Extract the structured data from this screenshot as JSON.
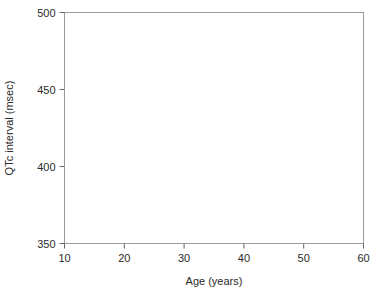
{
  "chart_data": {
    "type": "scatter",
    "title": "",
    "subtitle": "",
    "xlabel": "Age (years)",
    "ylabel": "QTc interval (msec)",
    "xlim": [
      10,
      60
    ],
    "ylim": [
      350,
      500
    ],
    "xticks": [
      10,
      20,
      30,
      40,
      50,
      60
    ],
    "yticks": [
      350,
      400,
      450,
      500
    ],
    "xtick_labels": [
      "10",
      "20",
      "30",
      "40",
      "50",
      "60"
    ],
    "ytick_labels": [
      "350",
      "400",
      "450",
      "500"
    ],
    "grid": false,
    "legend": "none",
    "frame": true,
    "point_color": "#555555",
    "line_color": "#111111",
    "series": [
      {
        "name": "upper-percentile-line",
        "style": "dashed",
        "type": "line",
        "x": [
          10,
          20,
          60
        ],
        "y": [
          441,
          436,
          479
        ]
      },
      {
        "name": "median-regression-line",
        "style": "solid",
        "type": "line",
        "x": [
          10,
          20,
          60
        ],
        "y": [
          415,
          410,
          450
        ]
      },
      {
        "name": "qtc-observations",
        "style": "points",
        "type": "scatter",
        "n_points": 760,
        "x": [
          10.2,
          10.4,
          10.5,
          10.6,
          10.7,
          10.8,
          10.9,
          11.0,
          11.1,
          11.2,
          11.3,
          11.4,
          11.5,
          11.6,
          11.7,
          11.8,
          11.9,
          12.0,
          12.1,
          12.2,
          12.3,
          12.4,
          12.5,
          12.6,
          12.7,
          12.8,
          12.9,
          13.0,
          13.1,
          13.2,
          13.3,
          13.4,
          13.5,
          13.6,
          13.7,
          13.8,
          13.9,
          14.0,
          14.1,
          14.2,
          14.3,
          14.4,
          14.5,
          14.6,
          14.7,
          14.8,
          14.9,
          15.0,
          15.1,
          15.2,
          15.3,
          15.4,
          15.5,
          15.6,
          15.7,
          15.8,
          15.9,
          16.0,
          16.1,
          16.2,
          16.3,
          16.4,
          16.5,
          16.6,
          16.7,
          16.8,
          16.9,
          17.0,
          17.1,
          17.2,
          17.3,
          17.4,
          17.5,
          17.6,
          17.7,
          17.8,
          17.9,
          18.0,
          18.1,
          18.2,
          18.3,
          18.4,
          18.5,
          18.6,
          18.7,
          18.8,
          18.9,
          19.0,
          19.1,
          19.2,
          19.3,
          19.4,
          19.5,
          19.6,
          19.7,
          19.8,
          19.9,
          20.0,
          20.1,
          20.2,
          20.3,
          20.4,
          20.5,
          20.6,
          20.7,
          20.8,
          20.9,
          21.0,
          21.1,
          21.2,
          21.3,
          21.4,
          21.5,
          21.6,
          21.7,
          21.8,
          21.9,
          22.0,
          22.1,
          22.2,
          22.3,
          22.4,
          22.5,
          22.6,
          22.7,
          22.8,
          22.9,
          23.0,
          23.1,
          23.2,
          23.3,
          23.4,
          23.5,
          23.6,
          23.7,
          23.8,
          23.9,
          24.0,
          24.1,
          24.2,
          24.3,
          24.4,
          24.5,
          24.6,
          24.7,
          24.8,
          24.9,
          25.0,
          25.1,
          25.2,
          25.3,
          25.4,
          25.5,
          25.6,
          25.7,
          25.8,
          25.9,
          26.0,
          26.1,
          26.2,
          26.3,
          26.4,
          26.5,
          26.6,
          26.7,
          26.8,
          26.9,
          27.0,
          27.1,
          27.2,
          27.3,
          27.4,
          27.5,
          27.6,
          27.7,
          27.8,
          27.9,
          28.0,
          28.1,
          28.2,
          28.3,
          28.4,
          28.5,
          28.6,
          28.7,
          28.8,
          28.9,
          29.0,
          29.1,
          29.2,
          29.3,
          29.4,
          29.5,
          29.6,
          29.7,
          29.8,
          29.9,
          30.0,
          30.2,
          30.4,
          30.6,
          30.8,
          31.0,
          31.2,
          31.4,
          31.6,
          31.8,
          32.0,
          32.2,
          32.4,
          32.6,
          32.8,
          33.0,
          33.2,
          33.4,
          33.6,
          33.8,
          34.0,
          34.2,
          34.4,
          34.6,
          34.8,
          35.0,
          35.2,
          35.4,
          35.6,
          35.8,
          36.0,
          36.2,
          36.4,
          36.6,
          36.8,
          37.0,
          37.2,
          37.4,
          37.6,
          37.8,
          38.0,
          38.2,
          38.4,
          38.6,
          38.8,
          39.0,
          39.2,
          39.4,
          39.6,
          39.8,
          40.0,
          40.3,
          40.6,
          40.9,
          41.2,
          41.5,
          41.8,
          42.1,
          42.4,
          42.7,
          43.0,
          43.3,
          43.6,
          43.9,
          44.2,
          44.5,
          44.8,
          45.1,
          45.4,
          45.7,
          46.0,
          46.3,
          46.6,
          46.9,
          47.2,
          47.5,
          47.8,
          48.1,
          48.4,
          48.7,
          49.0,
          49.3,
          49.6,
          49.9,
          50.2,
          50.5,
          50.8,
          51.1,
          51.4,
          51.7,
          52.0,
          52.3,
          52.6,
          52.9,
          53.2,
          53.5,
          53.8,
          54.1,
          54.4,
          54.7,
          55.0,
          55.3,
          55.6,
          55.9,
          56.2,
          56.5,
          56.8,
          57.1,
          57.4,
          57.7,
          58.0,
          58.3,
          58.6,
          58.9,
          59.2,
          59.5,
          59.8
        ],
        "x_note": "Observed ages are densest between 10 and 30 years and thin out toward 60 years.",
        "y_note": "QTc values scatter between roughly 365 and 495 msec, centred near 410-440 msec, widest spread at the youngest ages."
      }
    ],
    "annotations": []
  },
  "figure": {
    "background": "#ffffff",
    "frame_color": "#999999",
    "axis_color": "#555555",
    "text_color": "#2a2a2a"
  }
}
